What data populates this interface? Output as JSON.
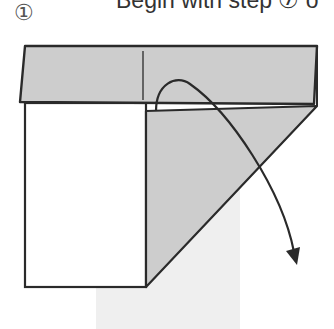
{
  "header": {
    "step_marker": "①",
    "instruction_text": "Begin with step ⑦ o"
  },
  "diagram": {
    "colors": {
      "paper_grey": "#cdcdcd",
      "shadow_grey": "#efefef",
      "outline": "#2a2a2a",
      "paper_white": "#ffffff"
    },
    "elements": [
      {
        "type": "folded-band",
        "label": "top folded band"
      },
      {
        "type": "panel",
        "label": "left white panel"
      },
      {
        "type": "flap",
        "label": "diagonal grey flap"
      },
      {
        "type": "arrow",
        "label": "fold direction arrow"
      }
    ]
  }
}
